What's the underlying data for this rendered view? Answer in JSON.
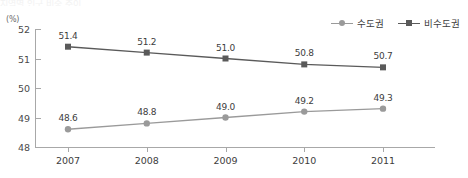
{
  "title_strip": "지역별 인구 비중 추이",
  "unit_label": "(%)",
  "legend": {
    "items": [
      {
        "label": "수도권",
        "marker": "circle-marker-icon",
        "color": "#9a9a9a"
      },
      {
        "label": "비수도권",
        "marker": "square-marker-icon",
        "color": "#5a5a5a"
      }
    ]
  },
  "axes": {
    "y_ticks": [
      "52",
      "51",
      "50",
      "49",
      "48"
    ],
    "x_ticks": [
      "2007",
      "2008",
      "2009",
      "2010",
      "2011"
    ]
  },
  "chart_data": {
    "type": "line",
    "title": "지역별 인구 비중 추이",
    "xlabel": "",
    "ylabel": "(%)",
    "ylim": [
      48,
      52
    ],
    "yticks": [
      48,
      49,
      50,
      51,
      52
    ],
    "grid": false,
    "legend_position": "top-right",
    "categories": [
      "2007",
      "2008",
      "2009",
      "2010",
      "2011"
    ],
    "series": [
      {
        "name": "수도권",
        "marker": "circle",
        "color": "#9a9a9a",
        "values": [
          48.6,
          48.8,
          49.0,
          49.2,
          49.3
        ],
        "labels": [
          "48.6",
          "48.8",
          "49.0",
          "49.2",
          "49.3"
        ]
      },
      {
        "name": "비수도권",
        "marker": "square",
        "color": "#5a5a5a",
        "values": [
          51.4,
          51.2,
          51.0,
          50.8,
          50.7
        ],
        "labels": [
          "51.4",
          "51.2",
          "51.0",
          "50.8",
          "50.7"
        ]
      }
    ]
  }
}
